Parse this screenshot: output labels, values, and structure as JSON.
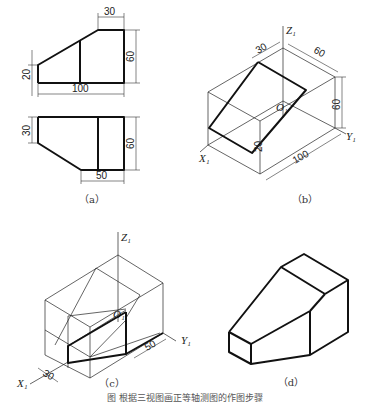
{
  "figure": {
    "caption": "图  根据三视图画正等轴测图的作图步骤",
    "panels": {
      "a": {
        "label": "（a）",
        "front_view": {
          "dims": {
            "top_width": "30",
            "left_height": "20",
            "total_width": "100",
            "total_height": "60"
          }
        },
        "top_view": {
          "dims": {
            "left_depth": "30",
            "bottom_width": "50",
            "total_depth": "60"
          }
        }
      },
      "b": {
        "label": "（b）",
        "axes": {
          "z": "Z₁",
          "x": "X₁",
          "y": "Y₁",
          "origin": "O₁"
        },
        "dims": {
          "top": "30",
          "depth": "60",
          "height": "60",
          "length": "100",
          "bottom": "20"
        }
      },
      "c": {
        "label": "（c）",
        "axes": {
          "z": "Z₁",
          "x": "X₁",
          "y": "Y₁",
          "origin": "O₁"
        },
        "dims": {
          "left": "30",
          "right": "50"
        }
      },
      "d": {
        "label": "（d）"
      }
    }
  }
}
